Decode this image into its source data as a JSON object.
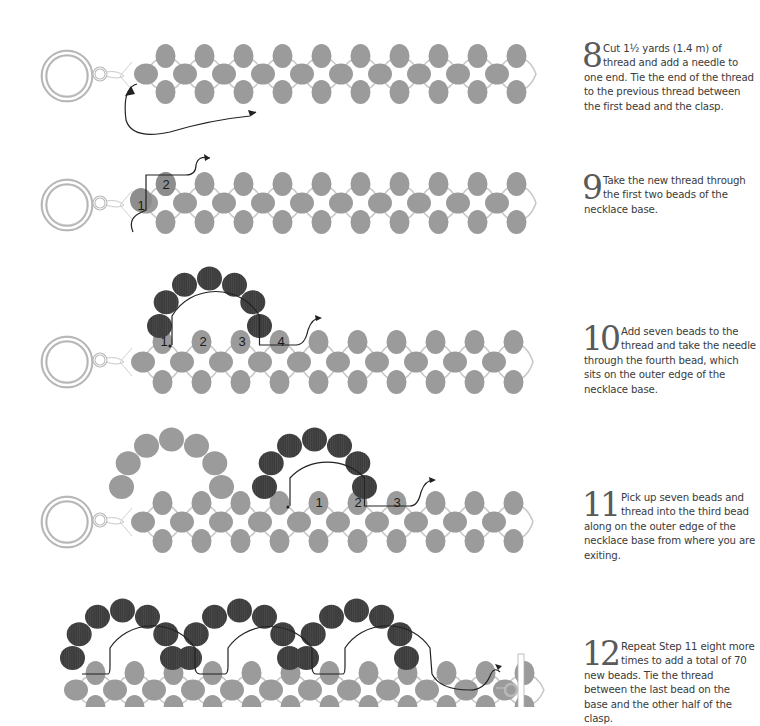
{
  "steps": [
    {
      "number": "8",
      "text": "Cut 1½ yards (1.4 m) of thread and add a needle to one end. Tie the end of the thread to the previous thread between the first bead and the clasp."
    },
    {
      "number": "9",
      "text": "Take the new thread through the first two beads of the necklace base."
    },
    {
      "number": "10",
      "text": "Add seven beads to the thread and take the needle through the fourth bead, which sits on the outer edge of the necklace base."
    },
    {
      "number": "11",
      "text": "Pick up seven beads and thread into the third bead along on the outer edge of the necklace base from where you are exiting."
    },
    {
      "number": "12",
      "text": "Repeat Step 11 eight more times to add a total of 70 new beads. Tie the thread between the last bead on the base and the other half of the clasp."
    }
  ],
  "diagrams": [
    {
      "name": "step-8-diagram",
      "labels": []
    },
    {
      "name": "step-9-diagram",
      "labels": [
        "1",
        "2"
      ]
    },
    {
      "name": "step-10-diagram",
      "labels": [
        "1",
        "2",
        "3",
        "4"
      ]
    },
    {
      "name": "step-11-diagram",
      "labels": [
        "1",
        "2",
        "3"
      ]
    },
    {
      "name": "step-12-diagram",
      "labels": []
    }
  ],
  "colors": {
    "base_bead": "#9b9b9b",
    "new_bead": "#3c3c3c",
    "thread": "#222222",
    "clasp": "#b8b8b8",
    "text": "#3a3a3a"
  }
}
